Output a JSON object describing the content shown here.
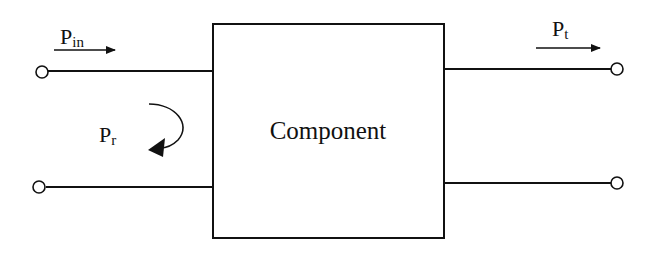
{
  "diagram": {
    "component_label": "Component",
    "input_power": {
      "symbol": "P",
      "subscript": "in"
    },
    "reflected_power": {
      "symbol": "P",
      "subscript": "r"
    },
    "transmitted_power": {
      "symbol": "P",
      "subscript": "t"
    },
    "colors": {
      "stroke": "#111111",
      "background": "#ffffff"
    }
  }
}
